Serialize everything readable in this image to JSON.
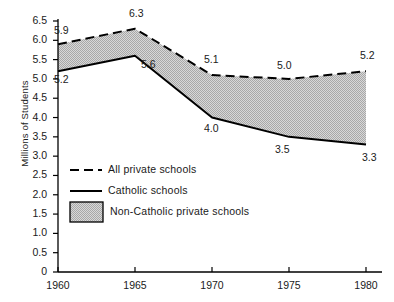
{
  "chart_data": {
    "type": "line",
    "title": "",
    "subtitle": "",
    "xlabel": "",
    "ylabel": "Millions of Students",
    "x": [
      1960,
      1965,
      1970,
      1975,
      1980
    ],
    "xticklabels": [
      "1960",
      "1965",
      "1970",
      "1975",
      "1980"
    ],
    "xlim": [
      1960,
      1980
    ],
    "ylim": [
      0,
      6.5
    ],
    "yticks": [
      0,
      0.5,
      1.0,
      1.5,
      2.0,
      2.5,
      3.0,
      3.5,
      4.0,
      4.5,
      5.0,
      5.5,
      6.0,
      6.5
    ],
    "yticklabels": [
      "0",
      "0.5",
      "1.0",
      "1.5",
      "2.0",
      "2.5",
      "3.0",
      "3.5",
      "4.0",
      "4.5",
      "5.0",
      "5.5",
      "6.0",
      "6.5"
    ],
    "grid": false,
    "legend_position": "inside-lower-left",
    "series": [
      {
        "name": "All private schools",
        "style": "dashed",
        "color": "#000000",
        "values": [
          5.9,
          6.3,
          5.1,
          5.0,
          5.2
        ],
        "labels": [
          "5.9",
          "6.3",
          "5.1",
          "5.0",
          "5.2"
        ]
      },
      {
        "name": "Catholic schools",
        "style": "solid",
        "color": "#000000",
        "values": [
          5.2,
          5.6,
          4.0,
          3.5,
          3.3
        ],
        "labels": [
          "5.2",
          "5.6",
          "4.0",
          "3.5",
          "3.3"
        ]
      }
    ],
    "band": {
      "name": "Non-Catholic private schools",
      "upper_series": "All private schools",
      "lower_series": "Catholic schools",
      "fill": "#c9c9c9"
    },
    "annotations": []
  },
  "legend": {
    "items": [
      {
        "label": "All private schools",
        "marker": "dashed-line"
      },
      {
        "label": "Catholic schools",
        "marker": "solid-line"
      },
      {
        "label": "Non-Catholic private schools",
        "marker": "filled-swatch"
      }
    ]
  },
  "colors": {
    "axis": "#000000",
    "line": "#000000",
    "band_fill": "#c9c9c9",
    "background": "#ffffff"
  }
}
